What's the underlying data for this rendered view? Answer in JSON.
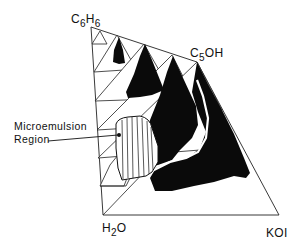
{
  "diagram": {
    "type": "ternary-phase-prism",
    "vertices": {
      "top": {
        "base": "C",
        "sub1": "6",
        "mid": "H",
        "sub2": "6"
      },
      "right_top": {
        "base": "C",
        "sub1": "5",
        "mid": "OH"
      },
      "bottom_left": {
        "base": "H",
        "sub1": "2",
        "mid": "O"
      },
      "bottom_right": {
        "text": "KOI"
      }
    },
    "annotation": {
      "line1": "Microemulsion",
      "line2": "Region"
    },
    "colors": {
      "ink": "#111111",
      "background": "#ffffff"
    }
  }
}
